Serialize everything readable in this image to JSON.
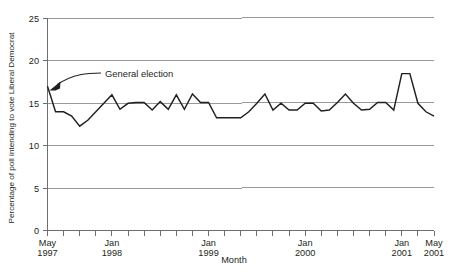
{
  "chart_data": {
    "type": "line",
    "title": "",
    "xlabel": "Month",
    "ylabel": "Percentage of poll intending to vote Liberal Democrat",
    "ylim": [
      0,
      25
    ],
    "ytick_labels": [
      "0",
      "5",
      "10",
      "15",
      "20",
      "25"
    ],
    "ytick_values": [
      0,
      5,
      10,
      15,
      20,
      25
    ],
    "xtick_labels": [
      {
        "line1": "May",
        "line2": "1997",
        "index": 0
      },
      {
        "line1": "Jan",
        "line2": "1998",
        "index": 8
      },
      {
        "line1": "Jan",
        "line2": "1999",
        "index": 20
      },
      {
        "line1": "Jan",
        "line2": "2000",
        "index": 32
      },
      {
        "line1": "Jan",
        "line2": "2001",
        "index": 44
      },
      {
        "line1": "May",
        "line2": "2001",
        "index": 48
      }
    ],
    "grid": "horizontal",
    "legend": "none",
    "x_minor_tick_interval_months": 2,
    "x": [
      "May 1997",
      "Jun 1997",
      "Jul 1997",
      "Aug 1997",
      "Sep 1997",
      "Oct 1997",
      "Nov 1997",
      "Dec 1997",
      "Jan 1998",
      "Feb 1998",
      "Mar 1998",
      "Apr 1998",
      "May 1998",
      "Jun 1998",
      "Jul 1998",
      "Aug 1998",
      "Sep 1998",
      "Oct 1998",
      "Nov 1998",
      "Dec 1998",
      "Jan 1999",
      "Feb 1999",
      "Mar 1999",
      "Apr 1999",
      "May 1999",
      "Jun 1999",
      "Jul 1999",
      "Aug 1999",
      "Sep 1999",
      "Oct 1999",
      "Nov 1999",
      "Dec 1999",
      "Jan 2000",
      "Feb 2000",
      "Mar 2000",
      "Apr 2000",
      "May 2000",
      "Jun 2000",
      "Jul 2000",
      "Aug 2000",
      "Sep 2000",
      "Oct 2000",
      "Nov 2000",
      "Dec 2000",
      "Jan 2001",
      "Feb 2001",
      "Mar 2001",
      "Apr 2001",
      "May 2001"
    ],
    "values": [
      17.0,
      14.0,
      14.0,
      13.5,
      12.3,
      13.0,
      14.0,
      15.0,
      16.0,
      14.3,
      15.0,
      15.1,
      15.1,
      14.2,
      15.2,
      14.3,
      16.0,
      14.3,
      16.1,
      15.1,
      15.1,
      13.3,
      13.3,
      13.3,
      13.3,
      14.0,
      15.0,
      16.1,
      14.2,
      15.0,
      14.2,
      14.2,
      15.0,
      15.0,
      14.1,
      14.2,
      15.1,
      16.1,
      15.0,
      14.2,
      14.3,
      15.1,
      15.1,
      14.2,
      18.5,
      18.5,
      15.0,
      14.0,
      13.5
    ],
    "series_color": "#231f20",
    "grid_color": "#8d8e90",
    "annotations": [
      {
        "text": "General election",
        "points_to": "May 1997",
        "points_to_value": 17.0
      }
    ]
  }
}
